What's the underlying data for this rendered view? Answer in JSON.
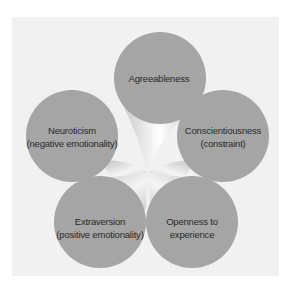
{
  "diagram": {
    "title": "",
    "colors": {
      "background": "#f1f1f1",
      "circle": "#a3a3a3",
      "text": "#2a2a2a"
    },
    "nodes": [
      {
        "id": "agreeableness",
        "line1": "Agreeableness",
        "line2": ""
      },
      {
        "id": "neuroticism",
        "line1": "Neuroticism",
        "line2": "(negative emotionality)"
      },
      {
        "id": "conscientiousness",
        "line1": "Conscientiousness",
        "line2": "(constraint)"
      },
      {
        "id": "extraversion",
        "line1": "Extraversion",
        "line2": "(positive emotionality)"
      },
      {
        "id": "openness",
        "line1": "Openness to",
        "line2": "experience"
      }
    ]
  }
}
